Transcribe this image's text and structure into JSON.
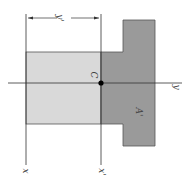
{
  "diagram": {
    "labels": {
      "dimension": "y'",
      "centroid": "C",
      "y_axis": "y",
      "area": "A'",
      "x_axis": "x",
      "x_prime_axis": "x'"
    },
    "colors": {
      "light_region": "#d9d9d9",
      "dark_region": "#9a9a9a",
      "outline": "#555555",
      "axis": "#333333"
    }
  }
}
